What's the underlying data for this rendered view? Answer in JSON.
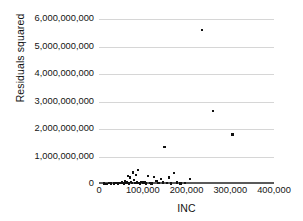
{
  "chart_data": {
    "type": "scatter",
    "title": "",
    "xlabel": "INC",
    "ylabel": "Residuals squared",
    "xlim": [
      0,
      400000
    ],
    "ylim": [
      0,
      6000000000
    ],
    "grid": "horizontal",
    "legend": "none",
    "x_ticks": [
      0,
      100000,
      200000,
      300000,
      400000
    ],
    "x_tick_labels": [
      "0",
      "100,000",
      "200,000",
      "300,000",
      "400,000"
    ],
    "y_ticks": [
      0,
      1000000000,
      2000000000,
      3000000000,
      4000000000,
      5000000000,
      6000000000
    ],
    "y_tick_labels": [
      "0",
      "1,000,000,000",
      "2,000,000,000",
      "3,000,000,000",
      "4,000,000,000",
      "5,000,000,000",
      "6,000,000,000"
    ],
    "marker": "square",
    "marker_color": "#111111",
    "grid_color": "#d6d6d6",
    "axis_color": "#5a5a5a",
    "points": [
      [
        11000,
        12000000
      ],
      [
        17000,
        9000000
      ],
      [
        23000,
        30000000
      ],
      [
        28000,
        18000000
      ],
      [
        34000,
        22000000
      ],
      [
        39000,
        40000000
      ],
      [
        44000,
        15000000
      ],
      [
        49000,
        35000000
      ],
      [
        53000,
        60000000
      ],
      [
        57000,
        25000000
      ],
      [
        60000,
        95000000
      ],
      [
        63000,
        48000000
      ],
      [
        66000,
        300000000
      ],
      [
        68000,
        20000000
      ],
      [
        71000,
        240000000
      ],
      [
        73000,
        70000000
      ],
      [
        76000,
        40000000
      ],
      [
        78000,
        420000000
      ],
      [
        80000,
        150000000
      ],
      [
        82000,
        30000000
      ],
      [
        85000,
        330000000
      ],
      [
        87000,
        55000000
      ],
      [
        89000,
        500000000
      ],
      [
        91000,
        45000000
      ],
      [
        94000,
        25000000
      ],
      [
        97000,
        80000000
      ],
      [
        100000,
        35000000
      ],
      [
        104000,
        60000000
      ],
      [
        108000,
        18000000
      ],
      [
        112000,
        290000000
      ],
      [
        116000,
        40000000
      ],
      [
        120000,
        22000000
      ],
      [
        126000,
        250000000
      ],
      [
        131000,
        120000000
      ],
      [
        136000,
        30000000
      ],
      [
        141000,
        180000000
      ],
      [
        146000,
        55000000
      ],
      [
        150000,
        1350000000
      ],
      [
        155000,
        40000000
      ],
      [
        160000,
        230000000
      ],
      [
        165000,
        25000000
      ],
      [
        172000,
        390000000
      ],
      [
        178000,
        60000000
      ],
      [
        186000,
        20000000
      ],
      [
        196000,
        35000000
      ],
      [
        208000,
        190000000
      ],
      [
        235000,
        5600000000
      ],
      [
        260000,
        2650000000
      ],
      [
        305000,
        1800000000
      ]
    ]
  }
}
